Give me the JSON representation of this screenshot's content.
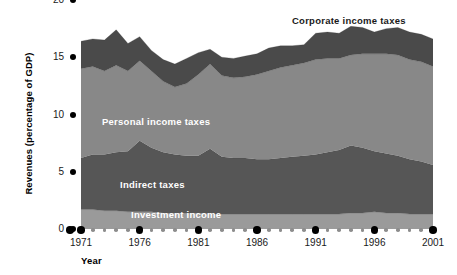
{
  "chart_data": {
    "type": "area",
    "stacked": true,
    "title": "",
    "xlabel": "Year",
    "ylabel": "Revenues (percentage of GDP)",
    "xlim": [
      1971,
      2001
    ],
    "ylim": [
      0,
      20
    ],
    "yticks": [
      0,
      5,
      10,
      15,
      20
    ],
    "ytick_labels": [
      "0",
      "5",
      "10",
      "15",
      "20"
    ],
    "xticks": [
      1971,
      1976,
      1981,
      1986,
      1991,
      1996,
      2001
    ],
    "xtick_labels": [
      "1971",
      "1976",
      "1981",
      "1986",
      "1991",
      "1996",
      "2001"
    ],
    "grid": false,
    "legend_position": "inline-band-labels",
    "x": [
      1971,
      1972,
      1973,
      1974,
      1975,
      1976,
      1977,
      1978,
      1979,
      1980,
      1981,
      1982,
      1983,
      1984,
      1985,
      1986,
      1987,
      1988,
      1989,
      1990,
      1991,
      1992,
      1993,
      1994,
      1995,
      1996,
      1997,
      1998,
      1999,
      2000,
      2001
    ],
    "series": [
      {
        "name": "Investment income",
        "color": "#9a9a9a",
        "label_color": "#ffffff",
        "values": [
          1.7,
          1.7,
          1.6,
          1.6,
          1.5,
          1.5,
          1.5,
          1.4,
          1.4,
          1.4,
          1.4,
          1.3,
          1.3,
          1.3,
          1.3,
          1.3,
          1.3,
          1.3,
          1.3,
          1.3,
          1.3,
          1.3,
          1.3,
          1.4,
          1.4,
          1.5,
          1.4,
          1.4,
          1.3,
          1.3,
          1.3
        ]
      },
      {
        "name": "Indirect taxes",
        "color": "#565656",
        "label_color": "#ffffff",
        "values": [
          4.5,
          4.8,
          4.9,
          5.1,
          5.3,
          6.2,
          5.6,
          5.3,
          5.1,
          5.0,
          5.0,
          5.7,
          5.0,
          4.9,
          4.9,
          4.8,
          4.8,
          4.9,
          5.0,
          5.1,
          5.2,
          5.4,
          5.6,
          5.9,
          5.7,
          5.3,
          5.2,
          5.0,
          4.8,
          4.6,
          4.3
        ]
      },
      {
        "name": "Personal income taxes",
        "color": "#888888",
        "label_color": "#ffffff",
        "values": [
          7.8,
          7.7,
          7.3,
          7.6,
          7.0,
          7.0,
          6.7,
          6.2,
          5.9,
          6.3,
          7.1,
          7.4,
          7.1,
          7.0,
          7.1,
          7.4,
          7.7,
          7.9,
          8.0,
          8.1,
          8.3,
          8.2,
          8.0,
          7.9,
          8.2,
          8.5,
          8.7,
          8.8,
          8.7,
          8.7,
          8.6
        ]
      },
      {
        "name": "Corporate income taxes",
        "color": "#4a4a4a",
        "label_color": "#1a1a1a",
        "values": [
          2.4,
          2.4,
          2.7,
          3.1,
          2.4,
          2.1,
          1.8,
          1.9,
          2.0,
          2.2,
          1.9,
          1.3,
          1.6,
          1.7,
          1.8,
          1.8,
          2.0,
          1.9,
          1.7,
          1.6,
          2.3,
          2.3,
          2.2,
          2.5,
          2.3,
          1.9,
          2.2,
          2.4,
          2.4,
          2.4,
          2.4
        ]
      }
    ],
    "band_labels": [
      {
        "name": "Corporate income taxes",
        "x": 292,
        "y": 15,
        "tone": "dark"
      },
      {
        "name": "Personal income taxes",
        "x": 102,
        "y": 116,
        "tone": "light"
      },
      {
        "name": "Indirect taxes",
        "x": 120,
        "y": 179,
        "tone": "light"
      },
      {
        "name": "Investment income",
        "x": 131,
        "y": 209,
        "tone": "light"
      }
    ]
  }
}
